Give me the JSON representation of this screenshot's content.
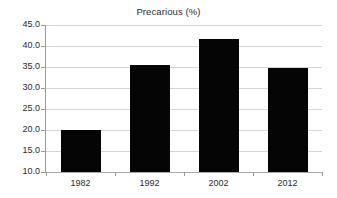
{
  "chart_data": {
    "type": "bar",
    "title": "Precarious (%)",
    "xlabel": "",
    "ylabel": "",
    "categories": [
      "1982",
      "1992",
      "2002",
      "2012"
    ],
    "values": [
      20.0,
      35.4,
      41.6,
      34.8
    ],
    "ylim": [
      10.0,
      45.0
    ],
    "ytick_step": 5.0,
    "yticks": [
      "45.0",
      "40.0",
      "35.0",
      "30.0",
      "25.0",
      "20.0",
      "15.0",
      "10.0"
    ],
    "ytick_values": [
      45.0,
      40.0,
      35.0,
      30.0,
      25.0,
      20.0,
      15.0,
      10.0
    ],
    "grid": true,
    "legend": false,
    "bar_color": "#050505",
    "grid_color": "#d5d5d5",
    "axis_color": "#9a9a9a",
    "text_color": "#2b2b2b",
    "background": "#ffffff"
  }
}
